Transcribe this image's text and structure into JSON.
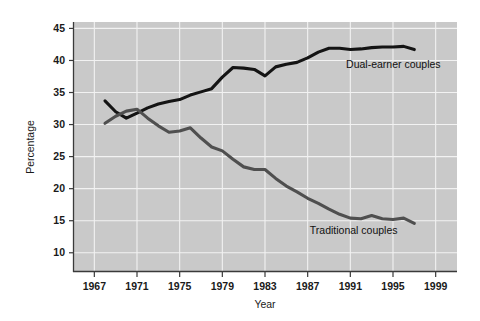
{
  "chart_data": {
    "type": "line",
    "title": "",
    "xlabel": "Year",
    "ylabel": "Percentage",
    "xlim": [
      1965,
      2001
    ],
    "ylim": [
      7,
      46
    ],
    "xticks": [
      1967,
      1971,
      1975,
      1979,
      1983,
      1987,
      1991,
      1995,
      1999
    ],
    "xtick_labels": [
      "1967",
      "1971",
      "1975",
      "1979",
      "1983",
      "1987",
      "1991",
      "1995",
      "1999"
    ],
    "yticks": [
      10,
      15,
      20,
      25,
      30,
      35,
      40,
      45
    ],
    "ytick_labels": [
      "10",
      "15",
      "20",
      "25",
      "30",
      "35",
      "40",
      "45"
    ],
    "grid": true,
    "grid_color": "#f2f2f2",
    "plot_background": "#c9c9c9",
    "page_background": "#ffffff",
    "legend_position": "inline-annotations",
    "x": [
      1968,
      1969,
      1970,
      1971,
      1972,
      1973,
      1974,
      1975,
      1976,
      1977,
      1978,
      1979,
      1980,
      1981,
      1982,
      1983,
      1984,
      1985,
      1986,
      1987,
      1988,
      1989,
      1990,
      1991,
      1992,
      1993,
      1994,
      1995,
      1996,
      1997
    ],
    "series": [
      {
        "name": "Dual-earner couples",
        "color": "#141414",
        "line_width": 3.1,
        "annotation": "Dual-earner couples",
        "values": [
          33.7,
          32.0,
          31.0,
          31.8,
          32.6,
          33.2,
          33.6,
          33.9,
          34.6,
          35.1,
          35.6,
          37.4,
          38.9,
          38.8,
          38.6,
          37.6,
          39.0,
          39.4,
          39.7,
          40.4,
          41.3,
          41.9,
          41.9,
          41.7,
          41.8,
          42.0,
          42.1,
          42.1,
          42.2,
          41.7
        ]
      },
      {
        "name": "Traditional couples",
        "color": "#4f4f4f",
        "line_width": 3.1,
        "annotation": "Traditional couples",
        "values": [
          30.2,
          31.3,
          32.1,
          32.4,
          31.0,
          29.8,
          28.8,
          29.0,
          29.5,
          27.9,
          26.5,
          25.9,
          24.6,
          23.4,
          23.0,
          23.0,
          21.6,
          20.4,
          19.5,
          18.5,
          17.7,
          16.8,
          16.0,
          15.4,
          15.3,
          15.8,
          15.3,
          15.2,
          15.4,
          14.6
        ]
      }
    ]
  },
  "annotations": {
    "dual_earner": {
      "text": "Dual-earner couples",
      "x": 1990.6,
      "y": 38.8
    },
    "traditional": {
      "text": "Traditional couples",
      "x": 1987.2,
      "y": 13.0
    }
  },
  "axes": {
    "y_title": "Percentage",
    "x_title": "Year"
  }
}
